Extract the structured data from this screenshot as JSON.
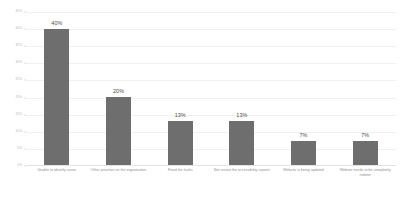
{
  "chart_data": {
    "type": "bar",
    "title": "",
    "subtitle": "",
    "xlabel": "",
    "ylabel": "",
    "ylim": [
      0,
      45
    ],
    "grid": true,
    "legend": false,
    "legend_position": "none",
    "bar_color": "#6e6e6e",
    "categories": [
      "Unable to identify cause",
      "Other priorities on the organisation",
      "Fixed the faults",
      "Not review the accessibility reports",
      "Website is being updated",
      "Website needs to be completely redone"
    ],
    "values": [
      40,
      20,
      13,
      13,
      7,
      7
    ],
    "data_labels": [
      "40%",
      "20%",
      "13%",
      "13%",
      "7%",
      "7%"
    ],
    "yticks": [
      0,
      5,
      10,
      15,
      20,
      25,
      30,
      35,
      40,
      45
    ],
    "ytick_labels": [
      "0%",
      "5%",
      "10%",
      "15%",
      "20%",
      "25%",
      "30%",
      "35%",
      "40%",
      "45%"
    ]
  }
}
